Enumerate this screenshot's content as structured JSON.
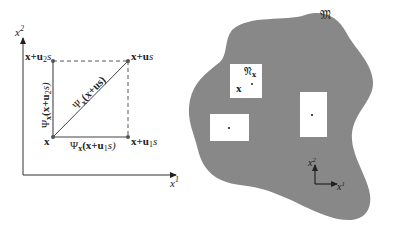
{
  "left_diagram": {
    "axes": {
      "y_label": "x",
      "y_label_sup": "2",
      "x_label": "x",
      "x_label_sup": "1"
    },
    "points": {
      "origin": "x",
      "top_left": {
        "base": "x+u",
        "sub": "2",
        "tail": "s"
      },
      "top_right": {
        "base": "x+u",
        "tail": "s"
      },
      "bottom_right": {
        "base": "x+u",
        "sub": "1",
        "tail": "s"
      }
    },
    "edge_labels": {
      "left": {
        "psi": "Ψ",
        "sub": "x",
        "arg_open": "(x+u",
        "arg_sub": "2",
        "arg_close": "s)"
      },
      "diagonal": {
        "psi": "Ψ",
        "sub": "x",
        "arg": "(x+us)"
      },
      "bottom": {
        "psi": "Ψ",
        "sub": "x",
        "arg_open": "(x+u",
        "arg_sub": "1",
        "arg_close": "s)"
      }
    },
    "colors": {
      "line": "#4a4a4a",
      "point": "#555555"
    }
  },
  "right_diagram": {
    "manifold_label": "𝔐",
    "neighborhood_label": "𝔑",
    "neighborhood_sub": "x",
    "point_label": "x",
    "local_axes": {
      "y_label": "x",
      "y_label_sup": "2",
      "x_label": "x",
      "x_label_sup": "1"
    },
    "colors": {
      "manifold_fill": "#888888",
      "patch_fill": "#ffffff"
    }
  }
}
